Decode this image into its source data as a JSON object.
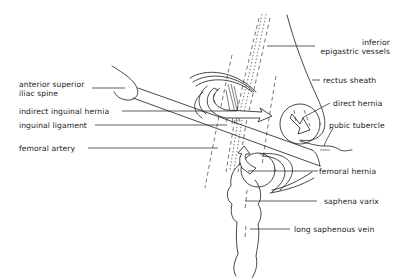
{
  "diagram": {
    "labels": {
      "inferior_epigastric_vessels": {
        "line1": "inferior",
        "line2": "epigastric vessels"
      },
      "rectus_sheath": "rectus sheath",
      "anterior_superior_iliac_spine": {
        "line1": "anterior superior",
        "line2": "iliac spine"
      },
      "direct_hernia": "direct hernia",
      "indirect_inguinal_hernia": "indirect  inguinal hernia",
      "inguinal_ligament": "inguinal ligament",
      "pubic_tubercle": "pubic tubercle",
      "femoral_artery": "femoral artery",
      "femoral_hernia": "femoral  hernia",
      "saphena_varix": "saphena varix",
      "long_saphenous_vein": "long saphenous vein"
    },
    "colors": {
      "line": "#1a1a1a",
      "background": "#ffffff"
    }
  }
}
